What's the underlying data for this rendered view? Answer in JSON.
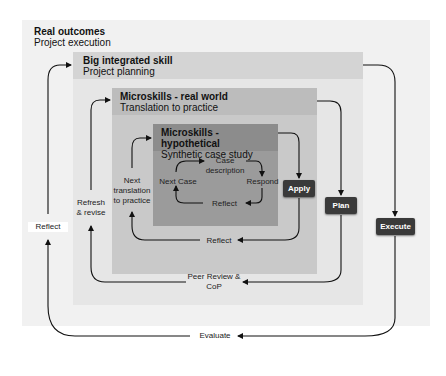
{
  "levels": {
    "real_outcomes": {
      "title": "Real outcomes",
      "subtitle": "Project execution"
    },
    "big_integrated": {
      "title": "Big integrated skill",
      "subtitle": "Project planning"
    },
    "real_world": {
      "title": "Microskills - real world",
      "subtitle": "Translation to practice"
    },
    "hypothetical": {
      "title": "Microskills - hypothetical",
      "subtitle": "Synthetic case study"
    }
  },
  "inner_cycle": {
    "case_description": "Case description",
    "respond": "Respond",
    "reflect": "Reflect",
    "next_case": "Next Case"
  },
  "actions": {
    "apply": "Apply",
    "plan": "Plan",
    "execute": "Execute"
  },
  "feedback_labels": {
    "reflect_inner": "Reflect",
    "next_translation": "Next translation to practice",
    "peer_review": "Peer Review & CoP",
    "refresh": "Refresh & revise",
    "evaluate": "Evaluate",
    "reflect_outer": "Reflect"
  },
  "colors": {
    "outer_bg": "#f1f1f1",
    "big_header": "#d4d4d4",
    "big_body": "#e6e6e6",
    "real_header": "#bcbcbc",
    "real_body": "#c9c9c9",
    "hypo_header": "#8c8c8c",
    "hypo_body": "#9b9b9b",
    "button": "#3a3a3a"
  }
}
